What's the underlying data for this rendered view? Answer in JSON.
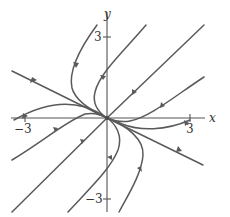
{
  "figure": {
    "type": "phase-portrait",
    "axes": {
      "x_label": "x",
      "y_label": "y",
      "x_ticks": [
        {
          "value": -3,
          "label": "−3"
        },
        {
          "value": 3,
          "label": "3"
        }
      ],
      "y_ticks": [
        {
          "value": 3,
          "label": "3"
        },
        {
          "value": -3,
          "label": "−3"
        }
      ]
    },
    "equilibrium": {
      "x": 0,
      "y": 0,
      "kind": "stable node"
    },
    "straight_line_solutions": [
      {
        "direction": "slope -1/2",
        "flow": "toward origin"
      }
    ],
    "trajectory_count": 11,
    "colors": {
      "curve": "#5a5a5a",
      "axis": "#555555",
      "text": "#333333",
      "background": "#ffffff"
    }
  }
}
